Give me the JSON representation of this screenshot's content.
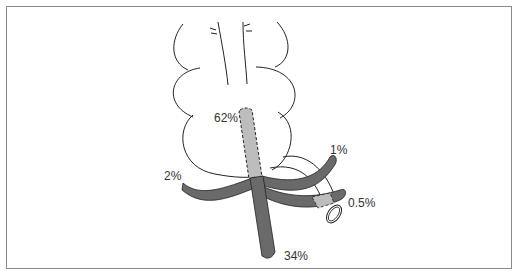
{
  "diagram": {
    "type": "anatomical schematic",
    "colors": {
      "dark_vessel": "#6a6a6a",
      "light_vessel": "#bdbdbd",
      "outline": "#222222",
      "frame": "#8a8a8a"
    },
    "labels": {
      "main_trunk_upper": "62%",
      "main_trunk_lower": "34%",
      "left_branch": "2%",
      "upper_right_branch": "1%",
      "lower_right_branch": "0.5%"
    }
  }
}
